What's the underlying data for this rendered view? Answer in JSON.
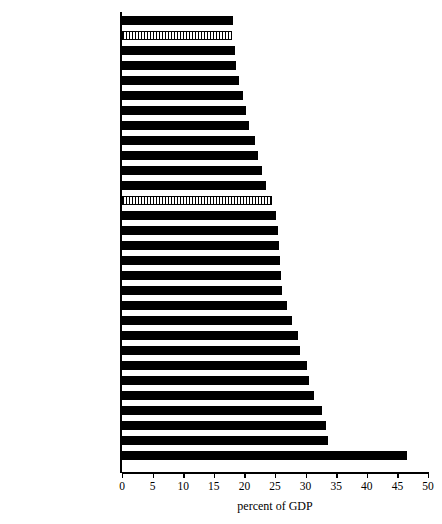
{
  "chart_data": {
    "type": "bar",
    "orientation": "horizontal",
    "title": "",
    "subtitle": "",
    "xlabel": "percent of GDP",
    "ylabel": "",
    "xlim": [
      0,
      50
    ],
    "xticks": [
      0,
      5,
      10,
      15,
      20,
      25,
      30,
      35,
      40,
      45,
      50
    ],
    "xtick_labels": [
      "0",
      "5",
      "10",
      "15",
      "20",
      "25",
      "30",
      "35",
      "40",
      "45",
      "50"
    ],
    "grid": false,
    "legend": null,
    "categories": [
      "Slovakia",
      "Korea",
      "Czech",
      "Chile",
      "Ireland",
      "United states",
      "Switzerland",
      "Turkey",
      "Slovenia",
      "Estonia",
      "Spain",
      "Germany",
      "OECD average",
      "Portugal",
      "Greece",
      "Israel",
      "Hungary",
      "Luxembourg",
      "United  Kingdom",
      "Canada",
      "Norway",
      "France",
      "Austria",
      "Italy",
      "Belgium",
      "Finland",
      "New Zealand",
      "Iceland",
      "Sweden",
      "Denmark"
    ],
    "values": [
      18.1,
      18.0,
      18.5,
      18.6,
      19.1,
      19.8,
      20.3,
      20.8,
      21.8,
      22.3,
      22.8,
      23.5,
      24.5,
      25.2,
      25.5,
      25.6,
      25.8,
      26.0,
      26.2,
      27.0,
      27.7,
      28.8,
      29.1,
      30.2,
      30.6,
      31.3,
      32.7,
      33.4,
      33.6,
      46.6
    ],
    "bar_styles": [
      "solid",
      "hatched",
      "solid",
      "solid",
      "solid",
      "solid",
      "solid",
      "solid",
      "solid",
      "solid",
      "solid",
      "solid",
      "hatched",
      "solid",
      "solid",
      "solid",
      "solid",
      "solid",
      "solid",
      "solid",
      "solid",
      "solid",
      "solid",
      "solid",
      "solid",
      "solid",
      "solid",
      "solid",
      "solid",
      "solid"
    ],
    "colors": {
      "bar_solid": "#000000",
      "bar_hatch_line": "#000000",
      "bar_hatch_background": "#ffffff",
      "axis": "#000000",
      "text": "#000000",
      "background": "#ffffff"
    }
  }
}
